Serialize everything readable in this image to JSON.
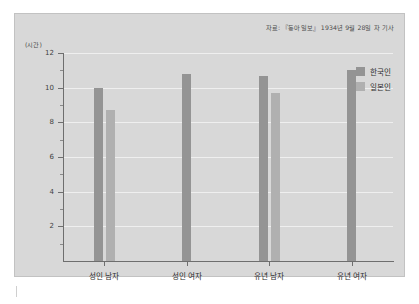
{
  "source_note": "자료: 『동아일보』 1934년 9월 28일 자 기사",
  "y_unit_label": "(시간)",
  "legend": {
    "items": [
      {
        "label": "한국인",
        "color": "#949494"
      },
      {
        "label": "일본인",
        "color": "#b0b0b0"
      }
    ]
  },
  "chart_data": {
    "type": "bar",
    "title": "",
    "subtitle": "",
    "xlabel": "",
    "ylabel": "(시간)",
    "ylim": [
      0,
      12
    ],
    "yticks": [
      0,
      2,
      4,
      6,
      8,
      10,
      12
    ],
    "ytick_labels": [
      "",
      "2",
      "4",
      "6",
      "8",
      "10",
      "12"
    ],
    "yminor_ticks": [
      1,
      3,
      5,
      7,
      9,
      11
    ],
    "grid": true,
    "grid_axis": "y",
    "legend_position": "top-right",
    "categories": [
      "성인 남자",
      "성인 여자",
      "유년 남자",
      "유년 여자"
    ],
    "series": [
      {
        "name": "한국인",
        "color": "#949494",
        "values": [
          10,
          10.8,
          10.7,
          11
        ]
      },
      {
        "name": "일본인",
        "color": "#b0b0b0",
        "values": [
          8.7,
          null,
          9.7,
          null
        ]
      }
    ],
    "source": "자료: 『동아일보』 1934년 9월 28일 자 기사"
  }
}
